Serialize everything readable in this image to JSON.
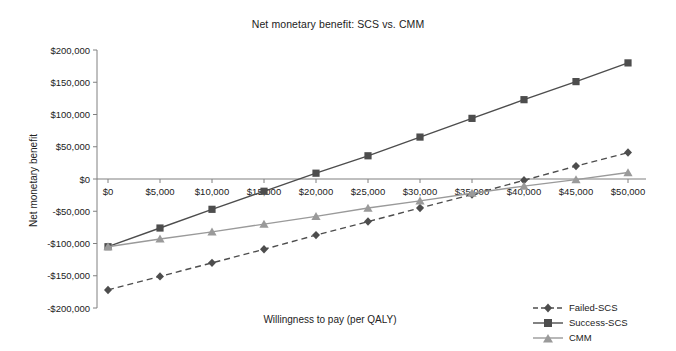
{
  "chart_data": {
    "type": "line",
    "title": "Net monetary benefit: SCS vs. CMM",
    "xlabel": "Willingness to pay (per QALY)",
    "ylabel": "Net monetary benefit",
    "x": [
      0,
      5000,
      10000,
      15000,
      20000,
      25000,
      30000,
      35000,
      40000,
      45000,
      50000
    ],
    "xtick_labels": [
      "$0",
      "$5,000",
      "$10,000",
      "$15,000",
      "$20,000",
      "$25,000",
      "$30,000",
      "$35,000",
      "$40,000",
      "$45,000",
      "$50,000"
    ],
    "ytick_labels": [
      "$200,000",
      "$150,000",
      "$100,000",
      "$50,000",
      "$0",
      "-$50,000",
      "-$100,000",
      "-$150,000",
      "-$200,000"
    ],
    "ytick_values": [
      200000,
      150000,
      100000,
      50000,
      0,
      -50000,
      -100000,
      -150000,
      -200000
    ],
    "xlim": [
      0,
      50000
    ],
    "ylim": [
      -200000,
      200000
    ],
    "grid": false,
    "legend_position": "bottom-right",
    "series": [
      {
        "name": "Failed-SCS",
        "marker": "diamond",
        "linestyle": "dashed",
        "color": "#4d4d4d",
        "values": [
          -172000,
          -151000,
          -130000,
          -109000,
          -87000,
          -66000,
          -45000,
          -24000,
          -2000,
          20000,
          41000
        ]
      },
      {
        "name": "Success-SCS",
        "marker": "square",
        "linestyle": "solid",
        "color": "#4d4d4d",
        "values": [
          -105000,
          -76000,
          -47000,
          -19000,
          9000,
          36000,
          65000,
          94000,
          123000,
          151000,
          180000
        ]
      },
      {
        "name": "CMM",
        "marker": "triangle",
        "linestyle": "solid",
        "color": "#9a9a9a",
        "values": [
          -105000,
          -93000,
          -82000,
          -70000,
          -58000,
          -45000,
          -34000,
          -22000,
          -11000,
          -1000,
          10000
        ]
      }
    ]
  },
  "legend": {
    "entries": [
      {
        "label": "Failed-SCS"
      },
      {
        "label": "Success-SCS"
      },
      {
        "label": "CMM"
      }
    ]
  },
  "colors": {
    "dark": "#4d4d4d",
    "light": "#9a9a9a",
    "axis": "#808080",
    "text": "#222222"
  }
}
